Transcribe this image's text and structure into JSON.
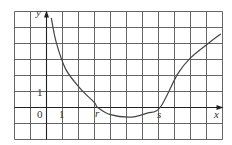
{
  "chart_data": {
    "type": "line",
    "title": "",
    "xlabel": "x",
    "ylabel": "y",
    "grid": true,
    "grid_cells": {
      "columns": 13,
      "rows": 8
    },
    "axis_origin_cell": {
      "col": 2,
      "row_from_bottom": 2
    },
    "xlim": [
      -2,
      11
    ],
    "ylim": [
      -2,
      6
    ],
    "tick_labels": {
      "origin": "0",
      "x_one": "1",
      "y_one": "1"
    },
    "roots": [
      {
        "label": "r",
        "x": 3.2
      },
      {
        "label": "s",
        "x": 7.1
      }
    ],
    "points": [
      {
        "x": 0.3,
        "y": 5.6
      },
      {
        "x": 0.6,
        "y": 4.1
      },
      {
        "x": 1.2,
        "y": 2.4
      },
      {
        "x": 2.1,
        "y": 1.2
      },
      {
        "x": 3.0,
        "y": 0.3
      },
      {
        "x": 3.2,
        "y": 0.0
      },
      {
        "x": 4.0,
        "y": -0.45
      },
      {
        "x": 5.3,
        "y": -0.6
      },
      {
        "x": 6.3,
        "y": -0.35
      },
      {
        "x": 7.1,
        "y": 0.0
      },
      {
        "x": 8.2,
        "y": 2.1
      },
      {
        "x": 9.0,
        "y": 3.1
      },
      {
        "x": 10.1,
        "y": 4.0
      },
      {
        "x": 10.9,
        "y": 4.6
      }
    ],
    "colors": {
      "grid": "#555555",
      "curve": "#444444",
      "axes": "#222222",
      "background": "#ffffff"
    }
  },
  "labels": {
    "y_axis": "y",
    "x_axis": "x",
    "origin": "0",
    "x_tick_one": "1",
    "y_tick_one": "1",
    "root_r": "r",
    "root_s": "s"
  }
}
